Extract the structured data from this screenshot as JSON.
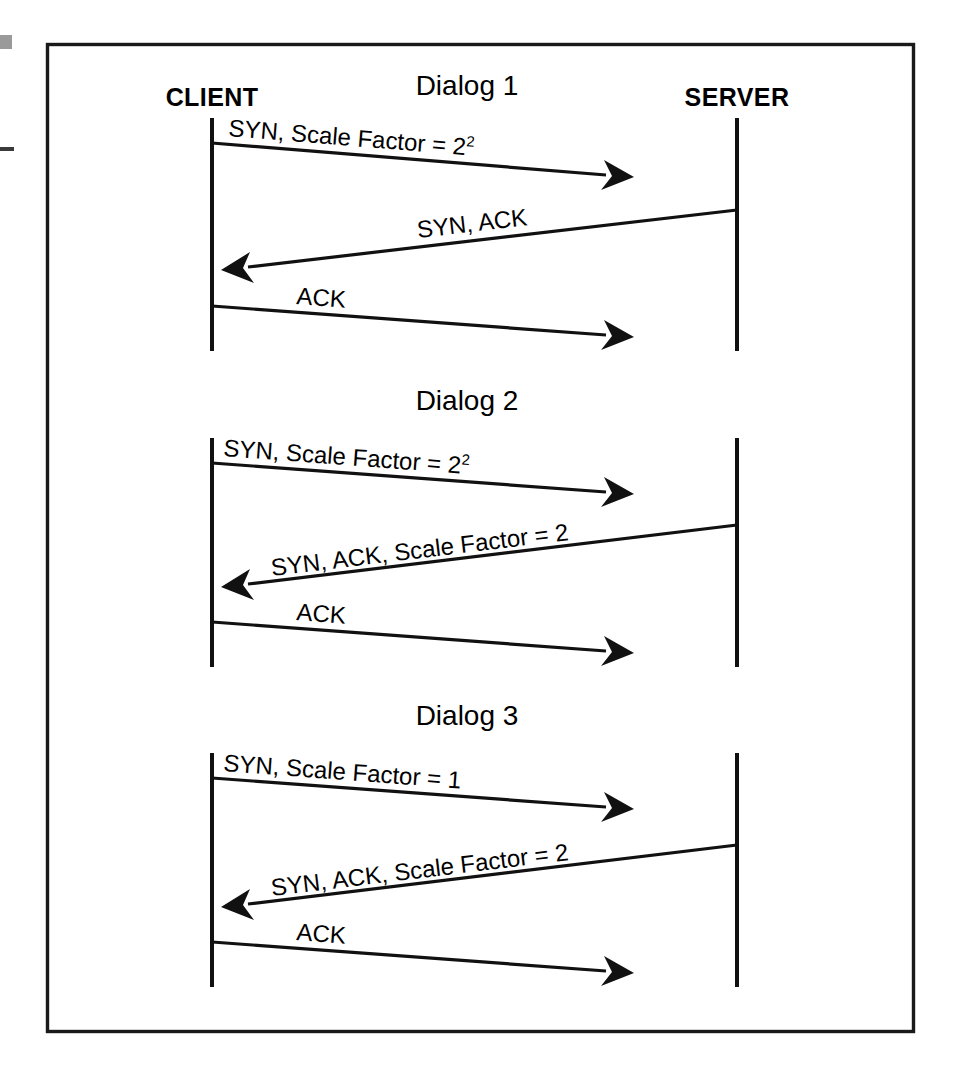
{
  "figure": {
    "kind": "sequence-diagram",
    "title_visible": false,
    "frame_color": "#1a1a1a",
    "ink_color": "#111111",
    "background": "#ffffff"
  },
  "participants": {
    "client_label": "CLIENT",
    "server_label": "SERVER"
  },
  "dialogs": [
    {
      "title": "Dialog 1",
      "messages": [
        {
          "label": "SYN, Scale Factor = 2",
          "superscript": "2",
          "direction": "client-to-server",
          "arrow": "right"
        },
        {
          "label": "SYN, ACK",
          "superscript": "",
          "direction": "server-to-client",
          "arrow": "left"
        },
        {
          "label": "ACK",
          "superscript": "",
          "direction": "client-to-server",
          "arrow": "right"
        }
      ]
    },
    {
      "title": "Dialog 2",
      "messages": [
        {
          "label": "SYN, Scale Factor = 2",
          "superscript": "2",
          "direction": "client-to-server",
          "arrow": "right"
        },
        {
          "label": "SYN, ACK, Scale Factor = 2",
          "superscript": "",
          "direction": "server-to-client",
          "arrow": "left"
        },
        {
          "label": "ACK",
          "superscript": "",
          "direction": "client-to-server",
          "arrow": "right"
        }
      ]
    },
    {
      "title": "Dialog 3",
      "messages": [
        {
          "label": "SYN, Scale Factor = 1",
          "superscript": "",
          "direction": "client-to-server",
          "arrow": "right"
        },
        {
          "label": "SYN, ACK, Scale Factor = 2",
          "superscript": "",
          "direction": "server-to-client",
          "arrow": "left"
        },
        {
          "label": "ACK",
          "superscript": "",
          "direction": "client-to-server",
          "arrow": "right"
        }
      ]
    }
  ]
}
